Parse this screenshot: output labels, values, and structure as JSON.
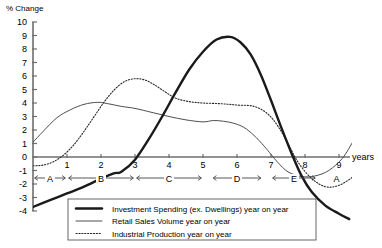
{
  "chart_data": {
    "type": "line",
    "title": "",
    "ylabel": "% Change",
    "xlabel": "years",
    "ylim": [
      -4,
      10
    ],
    "xlim": [
      0,
      9.6
    ],
    "grid": false,
    "legend_position": "bottom-center",
    "ytick_labels": [
      "10",
      "9",
      "8",
      "7",
      "6",
      "5",
      "4",
      "3",
      "2",
      "1",
      "0",
      "-1",
      "-2",
      "-3",
      "-4"
    ],
    "ytick_values": [
      10,
      9,
      8,
      7,
      6,
      5,
      4,
      3,
      2,
      1,
      0,
      -1,
      -2,
      -3,
      -4
    ],
    "xtick_labels": [
      "1",
      "2",
      "3",
      "4",
      "5",
      "6",
      "7",
      "8",
      "9"
    ],
    "xtick_values": [
      1,
      2,
      3,
      4,
      5,
      6,
      7,
      8,
      9
    ],
    "phases": [
      {
        "label": "A",
        "start": 0.05,
        "end": 0.95
      },
      {
        "label": "B",
        "start": 1.05,
        "end": 2.95
      },
      {
        "label": "C",
        "start": 3.05,
        "end": 4.95
      },
      {
        "label": "D",
        "start": 5.3,
        "end": 6.7
      },
      {
        "label": "E",
        "start": 7.05,
        "end": 8.3
      },
      {
        "label": "A",
        "start": 8.55,
        "end": 9.3,
        "bracket": false
      }
    ],
    "series": [
      {
        "name": "Investment Spending (ex. Dwellings) year on year",
        "style": "thick-solid",
        "color": "#1a1a1a",
        "x": [
          0.0,
          0.5,
          1.0,
          1.5,
          2.0,
          2.4,
          2.6,
          3.0,
          3.4,
          3.8,
          4.2,
          4.6,
          5.0,
          5.4,
          5.8,
          6.1,
          6.4,
          6.7,
          7.0,
          7.3,
          7.6,
          7.9,
          8.2,
          8.6,
          9.0,
          9.3
        ],
        "y": [
          -3.7,
          -3.2,
          -2.7,
          -2.2,
          -1.6,
          -1.2,
          -1.1,
          -0.2,
          1.3,
          3.0,
          4.8,
          6.5,
          7.8,
          8.7,
          8.9,
          8.5,
          7.6,
          6.1,
          4.2,
          2.2,
          0.3,
          -1.4,
          -2.6,
          -3.6,
          -4.2,
          -4.6
        ]
      },
      {
        "name": "Retail Sales Volume year on year",
        "style": "thin-solid",
        "color": "#3a3a3a",
        "x": [
          0.0,
          0.3,
          0.7,
          1.1,
          1.5,
          1.9,
          2.2,
          2.6,
          3.0,
          3.5,
          4.0,
          4.5,
          5.0,
          5.3,
          5.6,
          5.9,
          6.2,
          6.5,
          6.8,
          7.0,
          7.2,
          7.5,
          7.9,
          8.3,
          8.7,
          9.1,
          9.4
        ],
        "y": [
          1.1,
          1.9,
          2.9,
          3.5,
          3.9,
          4.05,
          3.95,
          3.75,
          3.6,
          3.3,
          3.0,
          2.75,
          2.6,
          2.7,
          2.65,
          2.5,
          2.2,
          1.6,
          0.8,
          0.2,
          -0.4,
          -1.1,
          -1.45,
          -1.4,
          -1.0,
          -0.1,
          1.1
        ]
      },
      {
        "name": "Industrial Production year on year",
        "style": "dotted",
        "color": "#2a2a2a",
        "x": [
          0.0,
          0.3,
          0.6,
          0.9,
          1.2,
          1.5,
          1.8,
          2.1,
          2.4,
          2.7,
          3.0,
          3.3,
          3.6,
          3.9,
          4.2,
          4.6,
          5.0,
          5.5,
          6.0,
          6.5,
          6.9,
          7.2,
          7.5,
          7.8,
          8.2,
          8.6,
          9.0,
          9.4
        ],
        "y": [
          -0.65,
          -0.6,
          -0.35,
          0.15,
          0.9,
          1.9,
          3.0,
          4.1,
          5.0,
          5.6,
          5.8,
          5.7,
          5.3,
          4.8,
          4.35,
          4.1,
          4.0,
          3.95,
          3.85,
          3.75,
          3.2,
          2.3,
          1.0,
          -0.4,
          -1.6,
          -2.2,
          -2.1,
          -1.5
        ]
      }
    ],
    "legend": [
      {
        "label": "Investment Spending (ex. Dwellings) year on year",
        "style": "thick-solid"
      },
      {
        "label": "Retail Sales Volume year on year",
        "style": "thin-solid"
      },
      {
        "label": "Industrial Production year on year",
        "style": "dotted"
      }
    ]
  }
}
